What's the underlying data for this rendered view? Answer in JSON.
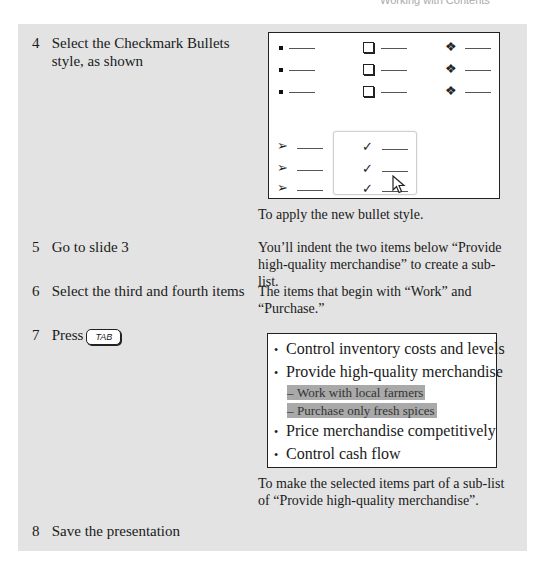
{
  "header": {
    "fragment": "Working with Contents"
  },
  "steps": [
    {
      "num": "4",
      "text": "Select the Checkmark Bullets style, as shown",
      "desc": "To apply the new bullet style."
    },
    {
      "num": "5",
      "text": "Go to slide 3",
      "desc": "You’ll indent the two items below “Provide high-quality merchandise” to create a sub-list."
    },
    {
      "num": "6",
      "text": "Select the third and fourth items",
      "desc": "The items that begin with “Work” and “Purchase.”"
    },
    {
      "num": "7",
      "text": "Press",
      "key": "TAB",
      "desc": "To make the selected items part of a sub-list of “Provide high-quality merchandise”."
    },
    {
      "num": "8",
      "text": "Save the presentation",
      "desc": ""
    }
  ],
  "gallery": {
    "styles": [
      "filled-square-bullets",
      "hollow-square-bullets",
      "star-diamond-bullets",
      "arrow-bullets",
      "checkmark-bullets"
    ],
    "selected": "checkmark-bullets",
    "glyphs": {
      "diamond": "❖",
      "arrow": "➢",
      "check": "✓"
    }
  },
  "slide": {
    "items": [
      {
        "level": 1,
        "bullet": "•",
        "text": "Control inventory costs and levels",
        "selected": false
      },
      {
        "level": 1,
        "bullet": "•",
        "text": "Provide high-quality merchandise",
        "selected": false
      },
      {
        "level": 2,
        "bullet": "–",
        "text": "Work with local farmers",
        "selected": true
      },
      {
        "level": 2,
        "bullet": "–",
        "text": "Purchase only fresh spices",
        "selected": true
      },
      {
        "level": 1,
        "bullet": "•",
        "text": "Price merchandise competitively",
        "selected": false
      },
      {
        "level": 1,
        "bullet": "•",
        "text": "Control cash flow",
        "selected": false
      }
    ]
  }
}
